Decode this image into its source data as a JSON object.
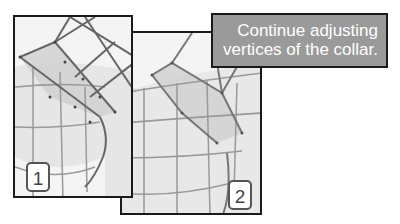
{
  "callout": {
    "line1": "Continue adjusting",
    "line2": "vertices of the collar."
  },
  "panels": [
    {
      "step": "1"
    },
    {
      "step": "2"
    }
  ],
  "colors": {
    "frame": "#1a1a1a",
    "callout_bg": "#9a9a9a",
    "callout_text": "#ffffff",
    "mesh": "#888888",
    "panel_bg": "#f4f4f4"
  }
}
